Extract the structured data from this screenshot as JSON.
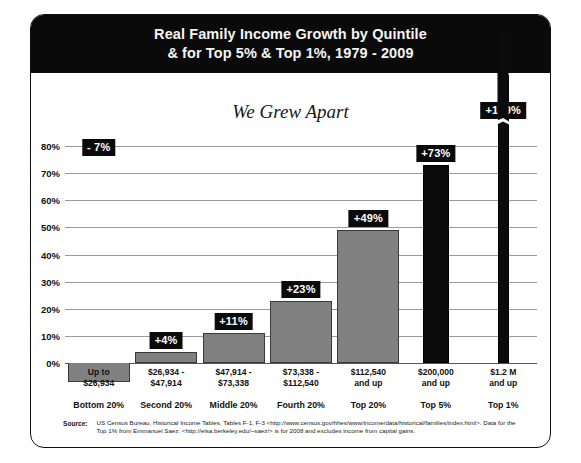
{
  "header": {
    "title_line1": "Real Family Income Growth by Quintile",
    "title_line2": "& for Top 5% & Top 1%, 1979 - 2009"
  },
  "subtitle": "We Grew Apart",
  "footer": {
    "source_label": "Source:",
    "source_line1": "US Census Bureau, Historical Income Tables, Tables F-1, F-3 <http://www.census.gov/hhes/www/income/data/historical/families/index.html>. Data for the",
    "source_line2": "Top 1% from Emmanuel Saez. <http://elsa.berkeley.edu/~saez/> is for 2008 and excludes income from capital gains."
  },
  "colors": {
    "header_bg": "#0a0a0a",
    "gray_bar": "#808080",
    "black_bar": "#0b0b0b",
    "gridline": "#9a9a9a",
    "label_bg": "#0b0b0b",
    "label_text": "#ffffff"
  },
  "chart_data": {
    "type": "bar",
    "title": "Real Family Income Growth by Quintile & for Top 5% & Top 1%, 1979 - 2009",
    "subtitle": "We Grew Apart",
    "xlabel": "",
    "ylabel": "",
    "ylim": [
      -10,
      80
    ],
    "grid": true,
    "legend": "none",
    "ytick_labels": [
      "80%",
      "70%",
      "60%",
      "50%",
      "40%",
      "30%",
      "20%",
      "10%",
      "0%"
    ],
    "ytick_values": [
      80,
      70,
      60,
      50,
      40,
      30,
      20,
      10,
      0
    ],
    "categories": [
      "Bottom 20%",
      "Second 20%",
      "Middle 20%",
      "Fourth 20%",
      "Top 20%",
      "Top 5%",
      "Top 1%"
    ],
    "category_ranges": [
      "Up to\n$26,934",
      "$26,934 -\n$47,914",
      "$47,914 -\n$73,338",
      "$73,338 -\n$112,540",
      "$112,540\nand up",
      "$200,000\nand up",
      "$1.2 M\nand up"
    ],
    "values": [
      -7,
      4,
      11,
      23,
      49,
      73,
      169
    ],
    "data_labels": [
      "- 7%",
      "+4%",
      "+11%",
      "+23%",
      "+49%",
      "+73%",
      "+169%"
    ],
    "bar_colors": [
      "#808080",
      "#808080",
      "#808080",
      "#808080",
      "#808080",
      "#0b0b0b",
      "#0b0b0b"
    ],
    "axis_break": {
      "series_index": 6,
      "note": "bar value 169% exceeds axis maximum; drawn with break marker"
    },
    "bars": [
      {
        "label": "Bottom 20%",
        "range_line1": "Up to",
        "range_line2": "$26,934",
        "value": -7,
        "data_label": "- 7%",
        "style": "gray"
      },
      {
        "label": "Second 20%",
        "range_line1": "$26,934 -",
        "range_line2": "$47,914",
        "value": 4,
        "data_label": "+4%",
        "style": "gray"
      },
      {
        "label": "Middle 20%",
        "range_line1": "$47,914 -",
        "range_line2": "$73,338",
        "value": 11,
        "data_label": "+11%",
        "style": "gray"
      },
      {
        "label": "Fourth 20%",
        "range_line1": "$73,338 -",
        "range_line2": "$112,540",
        "value": 23,
        "data_label": "+23%",
        "style": "gray"
      },
      {
        "label": "Top 20%",
        "range_line1": "$112,540",
        "range_line2": "and up",
        "value": 49,
        "data_label": "+49%",
        "style": "gray"
      },
      {
        "label": "Top 5%",
        "range_line1": "$200,000",
        "range_line2": "and up",
        "value": 73,
        "data_label": "+73%",
        "style": "black"
      },
      {
        "label": "Top 1%",
        "range_line1": "$1.2 M",
        "range_line2": "and up",
        "value": 169,
        "data_label": "+169%",
        "style": "black"
      }
    ]
  }
}
